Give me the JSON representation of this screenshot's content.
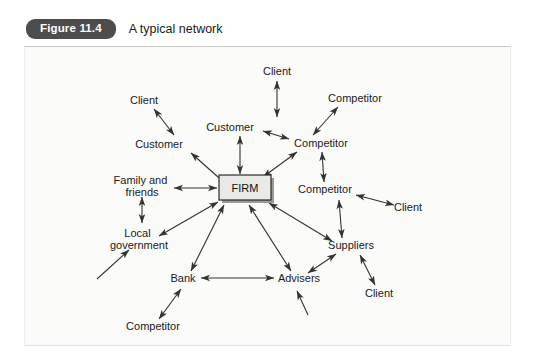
{
  "caption": {
    "badge": "Figure 11.4",
    "title": "A typical network"
  },
  "diagram": {
    "center": {
      "label": "FIRM"
    },
    "nodes": [
      {
        "id": "client-top",
        "label": "Client",
        "x": 252,
        "y": 24
      },
      {
        "id": "client-upperleft",
        "label": "Client",
        "x": 119,
        "y": 53
      },
      {
        "id": "competitor-topright",
        "label": "Competitor",
        "x": 330,
        "y": 51
      },
      {
        "id": "customer-top",
        "label": "Customer",
        "x": 247,
        "y": 80
      },
      {
        "id": "customer-left",
        "label": "Customer",
        "x": 153,
        "y": 97
      },
      {
        "id": "competitor-right1",
        "label": "Competitor",
        "x": 288,
        "y": 96
      },
      {
        "id": "family-and-friends",
        "label": "Family and friends",
        "x": 117,
        "y": 137
      },
      {
        "id": "competitor-right2",
        "label": "Competitor",
        "x": 300,
        "y": 144
      },
      {
        "id": "client-right",
        "label": "Client",
        "x": 383,
        "y": 164
      },
      {
        "id": "local-government",
        "label": "Local government",
        "x": 120,
        "y": 192
      },
      {
        "id": "suppliers",
        "label": "Suppliers",
        "x": 324,
        "y": 200
      },
      {
        "id": "bank",
        "label": "Bank",
        "x": 160,
        "y": 234
      },
      {
        "id": "advisers",
        "label": "Advisers",
        "x": 272,
        "y": 234
      },
      {
        "id": "client-bottomright",
        "label": "Client",
        "x": 348,
        "y": 248
      },
      {
        "id": "competitor-bottom",
        "label": "Competitor",
        "x": 128,
        "y": 281
      }
    ],
    "edges": [
      {
        "from": "client-top",
        "to": "customer-top",
        "arrows": "both"
      },
      {
        "from": "client-upperleft",
        "to": "customer-left",
        "arrows": "both"
      },
      {
        "from": "customer-left",
        "to": "firm",
        "arrows": "both"
      },
      {
        "from": "customer-top",
        "to": "firm",
        "arrows": "both"
      },
      {
        "from": "customer-top",
        "to": "competitor-right1",
        "arrows": "both"
      },
      {
        "from": "competitor-topright",
        "to": "competitor-right1",
        "arrows": "both"
      },
      {
        "from": "competitor-right1",
        "to": "firm",
        "arrows": "both"
      },
      {
        "from": "competitor-right1",
        "to": "competitor-right2",
        "arrows": "both"
      },
      {
        "from": "competitor-right2",
        "to": "client-right",
        "arrows": "both"
      },
      {
        "from": "competitor-right2",
        "to": "suppliers",
        "arrows": "both"
      },
      {
        "from": "family-and-friends",
        "to": "firm",
        "arrows": "both"
      },
      {
        "from": "family-and-friends",
        "to": "local-government",
        "arrows": "both"
      },
      {
        "from": "local-government",
        "to": "firm",
        "arrows": "both"
      },
      {
        "from": "bank",
        "to": "firm",
        "arrows": "both"
      },
      {
        "from": "bank",
        "to": "advisers",
        "arrows": "both"
      },
      {
        "from": "bank",
        "to": "competitor-bottom",
        "arrows": "both"
      },
      {
        "from": "advisers",
        "to": "firm",
        "arrows": "both"
      },
      {
        "from": "advisers",
        "to": "suppliers",
        "arrows": "both"
      },
      {
        "from": "suppliers",
        "to": "firm",
        "arrows": "both"
      },
      {
        "from": "suppliers",
        "to": "client-bottomright",
        "arrows": "both"
      }
    ],
    "stray_edges": [
      {
        "id": "stray-into-local-government",
        "arrows": "end"
      },
      {
        "id": "stray-into-advisers",
        "arrows": "end"
      }
    ]
  }
}
